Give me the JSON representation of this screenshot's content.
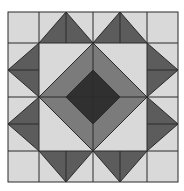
{
  "pattern": {
    "name": "quilt-block",
    "colors": {
      "background": "#ffffff",
      "light": "#d9d9d9",
      "medium": "#7b7b7b",
      "side_triangle": "#5c5c5c",
      "dark": "#303030",
      "line": "#2a2a2a"
    },
    "grid_x": [
      8,
      39,
      93,
      147,
      178
    ],
    "grid_y": [
      12,
      43,
      97,
      151,
      182
    ]
  }
}
